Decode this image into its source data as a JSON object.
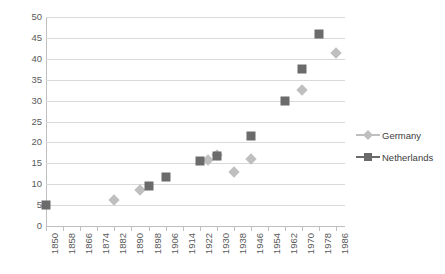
{
  "chart_data": {
    "type": "scatter",
    "title": "",
    "subtitle": "",
    "xlabel": "",
    "ylabel": "",
    "xlim": [
      1850,
      1990
    ],
    "ylim": [
      0,
      50
    ],
    "ytick_step": 5,
    "yticks": [
      0,
      5,
      10,
      15,
      20,
      25,
      30,
      35,
      40,
      45,
      50
    ],
    "xticks": [
      1850,
      1858,
      1866,
      1874,
      1882,
      1890,
      1898,
      1906,
      1914,
      1922,
      1930,
      1938,
      1946,
      1954,
      1962,
      1970,
      1978,
      1986
    ],
    "xtick_labels": [
      "1850",
      "1858",
      "1866",
      "1874",
      "1882",
      "1890",
      "1898",
      "1906",
      "1914",
      "1922",
      "1930",
      "1938",
      "1946",
      "1954",
      "1962",
      "1970",
      "1978",
      "1986"
    ],
    "ytick_labels": [
      "0",
      "5",
      "10",
      "15",
      "20",
      "25",
      "30",
      "35",
      "40",
      "45",
      "50"
    ],
    "grid": true,
    "grid_axis": "y",
    "legend_position": "right",
    "series": [
      {
        "name": "Germany",
        "marker": "diamond",
        "color": "#bfbfbf",
        "points": [
          {
            "x": 1882,
            "y": 6.2
          },
          {
            "x": 1894,
            "y": 8.5
          },
          {
            "x": 1926,
            "y": 15.7
          },
          {
            "x": 1930,
            "y": 17.0
          },
          {
            "x": 1938,
            "y": 12.8
          },
          {
            "x": 1946,
            "y": 16.0
          },
          {
            "x": 1970,
            "y": 32.5
          },
          {
            "x": 1986,
            "y": 41.5
          }
        ]
      },
      {
        "name": "Netherlands",
        "marker": "square",
        "color": "#6b6b6b",
        "points": [
          {
            "x": 1850,
            "y": 5.0
          },
          {
            "x": 1898,
            "y": 9.5
          },
          {
            "x": 1906,
            "y": 11.8
          },
          {
            "x": 1922,
            "y": 15.5
          },
          {
            "x": 1930,
            "y": 16.8
          },
          {
            "x": 1946,
            "y": 21.5
          },
          {
            "x": 1962,
            "y": 30.0
          },
          {
            "x": 1970,
            "y": 37.5
          },
          {
            "x": 1978,
            "y": 46.0
          }
        ]
      }
    ]
  },
  "legend": {
    "entries": [
      {
        "label": "Germany"
      },
      {
        "label": "Netherlands"
      }
    ]
  },
  "colors": {
    "germany": "#bfbfbf",
    "netherlands": "#6b6b6b",
    "gridline": "#d9d9d9",
    "axis": "#bfbfbf",
    "text": "#595959",
    "background": "#ffffff"
  }
}
